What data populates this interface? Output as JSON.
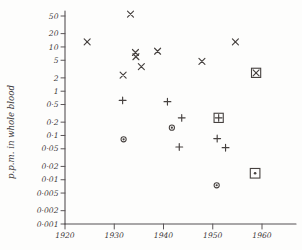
{
  "chart_data": {
    "type": "scatter",
    "title": "",
    "subtitle": "",
    "xlabel": "",
    "ylabel": "p.p.m. in whole blood",
    "xlim": [
      1920,
      1964
    ],
    "ylim": [
      0.001,
      80
    ],
    "yscale": "log",
    "xscale": "linear",
    "grid": false,
    "legend": "none",
    "x_ticks": [
      1920,
      1930,
      1940,
      1950,
      1960
    ],
    "x_tick_labels": [
      "1920",
      "1930",
      "1940",
      "1950",
      "1960"
    ],
    "y_ticks": [
      50,
      20,
      10,
      5,
      2,
      1,
      0.5,
      0.2,
      0.1,
      0.05,
      0.02,
      0.01,
      0.005,
      0.002,
      0.001
    ],
    "y_tick_labels": [
      "50",
      "20",
      "10",
      "5",
      "2",
      "1",
      "0·5",
      "0·2",
      "0·1",
      "0·05",
      "0·02",
      "0·01",
      "0·005",
      "0·002",
      "0·001"
    ],
    "series": [
      {
        "name": "cross",
        "marker": "x",
        "points": [
          {
            "x": 1924.5,
            "y": 13
          },
          {
            "x": 1933.3,
            "y": 55
          },
          {
            "x": 1931.8,
            "y": 2.3
          },
          {
            "x": 1934.3,
            "y": 7.5
          },
          {
            "x": 1934.4,
            "y": 6.0
          },
          {
            "x": 1935.5,
            "y": 3.6
          },
          {
            "x": 1938.8,
            "y": 8.0
          },
          {
            "x": 1947.8,
            "y": 4.7
          },
          {
            "x": 1954.6,
            "y": 13
          }
        ]
      },
      {
        "name": "plus",
        "marker": "+",
        "points": [
          {
            "x": 1931.7,
            "y": 0.62
          },
          {
            "x": 1940.8,
            "y": 0.58
          },
          {
            "x": 1943.7,
            "y": 0.25
          },
          {
            "x": 1943.2,
            "y": 0.055
          },
          {
            "x": 1950.9,
            "y": 0.085
          },
          {
            "x": 1952.6,
            "y": 0.053
          }
        ]
      },
      {
        "name": "circle-dot",
        "marker": "circle-dot",
        "points": [
          {
            "x": 1931.9,
            "y": 0.082
          },
          {
            "x": 1941.7,
            "y": 0.15
          },
          {
            "x": 1950.8,
            "y": 0.0075
          }
        ]
      },
      {
        "name": "boxed-cross",
        "marker": "boxed-x",
        "points": [
          {
            "x": 1958.8,
            "y": 2.6
          }
        ]
      },
      {
        "name": "boxed-plus",
        "marker": "boxed-plus",
        "points": [
          {
            "x": 1951.2,
            "y": 0.25
          }
        ]
      },
      {
        "name": "boxed-dot",
        "marker": "boxed-dot",
        "points": [
          {
            "x": 1958.6,
            "y": 0.014
          }
        ]
      }
    ]
  }
}
